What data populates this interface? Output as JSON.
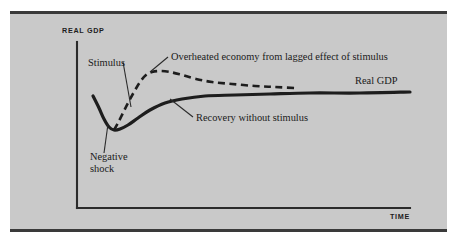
{
  "figure": {
    "background_color": "#c9c9c9",
    "page_color": "#ffffff",
    "ink_color": "#1d1d1d",
    "rule_color": "#3a3a3a"
  },
  "chart_data": {
    "type": "line",
    "title": "",
    "xlabel": "TIME",
    "ylabel": "REAL GDP",
    "grid": false,
    "legend": "inline-annotations",
    "axis": {
      "origin": [
        77,
        208
      ],
      "y_top": [
        77,
        42
      ],
      "x_right": [
        410,
        208
      ]
    },
    "series": [
      {
        "name": "Real GDP",
        "style": "solid",
        "label": "Real GDP",
        "label_pos": [
          355,
          84
        ],
        "points": [
          [
            93,
            96
          ],
          [
            99,
            108
          ],
          [
            104,
            119
          ],
          [
            109,
            127
          ],
          [
            114,
            130
          ],
          [
            120,
            129
          ],
          [
            128,
            125
          ],
          [
            138,
            118
          ],
          [
            150,
            110
          ],
          [
            165,
            103
          ],
          [
            182,
            99
          ],
          [
            205,
            96
          ],
          [
            235,
            95
          ],
          [
            270,
            94
          ],
          [
            310,
            93
          ],
          [
            360,
            93
          ],
          [
            410,
            92
          ]
        ]
      },
      {
        "name": "Overheated path with stimulus",
        "style": "dashed",
        "points": [
          [
            114,
            130
          ],
          [
            118,
            123
          ],
          [
            123,
            113
          ],
          [
            128,
            103
          ],
          [
            134,
            92
          ],
          [
            140,
            82
          ],
          [
            146,
            75
          ],
          [
            152,
            72
          ],
          [
            160,
            71
          ],
          [
            170,
            72
          ],
          [
            182,
            75
          ],
          [
            196,
            79
          ],
          [
            212,
            82
          ],
          [
            232,
            84
          ],
          [
            255,
            86
          ],
          [
            275,
            87
          ],
          [
            295,
            88
          ]
        ]
      }
    ],
    "annotations": [
      {
        "id": "stimulus",
        "text": "Stimulus",
        "text_pos": [
          88,
          66
        ],
        "leader": [
          [
            123,
            62
          ],
          [
            131,
            107
          ]
        ]
      },
      {
        "id": "overheated",
        "text": "Overheated economy from lagged effect of stimulus",
        "text_pos": [
          171,
          60
        ],
        "leader": [
          [
            168,
            57
          ],
          [
            150,
            72
          ]
        ]
      },
      {
        "id": "recovery",
        "text": "Recovery without stimulus",
        "text_pos": [
          196,
          121
        ],
        "leader": [
          [
            193,
            117
          ],
          [
            170,
            99
          ]
        ]
      },
      {
        "id": "negative-shock",
        "text_lines": [
          "Negative",
          "shock"
        ],
        "text_pos": [
          90,
          160
        ],
        "leader": [
          [
            104,
            153
          ],
          [
            108,
            124
          ]
        ]
      }
    ]
  },
  "labels": {
    "y_axis": "REAL GDP",
    "x_axis": "TIME",
    "real_gdp_series": "Real GDP",
    "stimulus": "Stimulus",
    "overheated": "Overheated economy from lagged effect of stimulus",
    "recovery": "Recovery without stimulus",
    "negative_shock_line1": "Negative",
    "negative_shock_line2": "shock"
  }
}
